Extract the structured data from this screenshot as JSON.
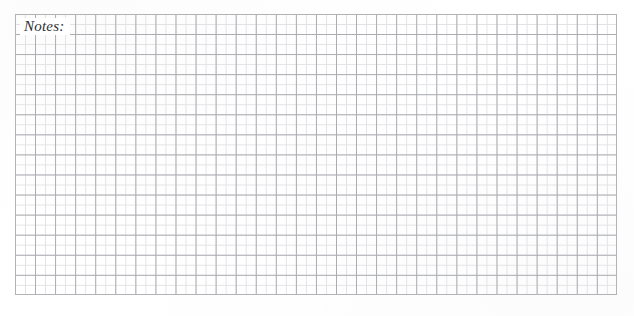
{
  "page": {
    "background_color": "#ffffff",
    "width": 634,
    "height": 316
  },
  "notes_section": {
    "label": "Notes:",
    "grid": {
      "major_line_color": "#aaabaf",
      "minor_line_color": "#e2e2e5",
      "border_color": "#b2b3b7",
      "major_spacing_px": 20,
      "minor_spacing_px": 10,
      "columns": 30,
      "rows": 14
    }
  }
}
